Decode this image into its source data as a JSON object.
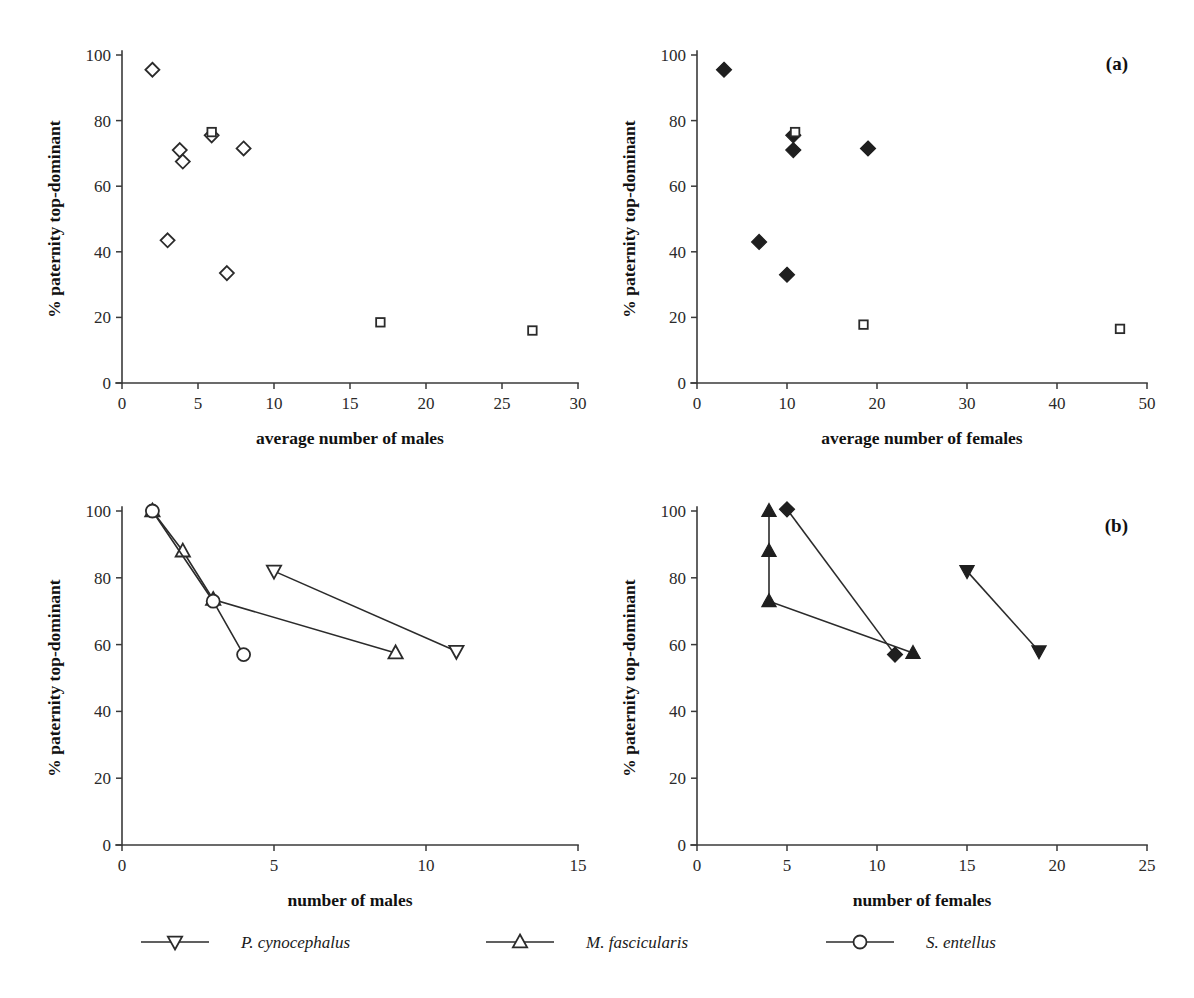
{
  "figure": {
    "panel_labels": {
      "a": "(a)",
      "b": "(b)"
    },
    "y_axis_title": "% paternity top-dominant"
  },
  "legend": {
    "position": "bottom-center",
    "entries": [
      {
        "label": "P. cynocephalus",
        "marker": "triangle-down",
        "filled_in_panel_b": true
      },
      {
        "label": "M. fascicularis",
        "marker": "triangle-up",
        "filled_in_panel_b": true
      },
      {
        "label": "S. entellus",
        "marker": "circle",
        "filled_in_panel_b": true
      }
    ]
  },
  "chart_data": [
    {
      "id": "panel-a-males",
      "type": "scatter",
      "title": "",
      "panel": "(a)",
      "xlabel": "average number of males",
      "ylabel": "% paternity top-dominant",
      "xlim": [
        0,
        30
      ],
      "ylim": [
        0,
        100
      ],
      "xticks": [
        0,
        5,
        10,
        15,
        20,
        25,
        30
      ],
      "yticks": [
        0,
        20,
        40,
        60,
        80,
        100
      ],
      "grid": false,
      "series": [
        {
          "name": "open diamonds",
          "marker": "diamond-open",
          "points": [
            {
              "x": 2.0,
              "y": 95.5
            },
            {
              "x": 3.0,
              "y": 43.5
            },
            {
              "x": 3.8,
              "y": 71.0
            },
            {
              "x": 4.0,
              "y": 67.5
            },
            {
              "x": 5.9,
              "y": 75.5
            },
            {
              "x": 6.9,
              "y": 33.5
            },
            {
              "x": 8.0,
              "y": 71.5
            }
          ]
        },
        {
          "name": "open squares",
          "marker": "square-open",
          "points": [
            {
              "x": 5.9,
              "y": 76.5
            },
            {
              "x": 17.0,
              "y": 18.5
            },
            {
              "x": 27.0,
              "y": 16.0
            }
          ]
        }
      ]
    },
    {
      "id": "panel-a-females",
      "type": "scatter",
      "title": "",
      "panel": "(a)",
      "xlabel": "average number of females",
      "ylabel": "% paternity top-dominant",
      "xlim": [
        0,
        50
      ],
      "ylim": [
        0,
        100
      ],
      "xticks": [
        0,
        10,
        20,
        30,
        40,
        50
      ],
      "yticks": [
        0,
        20,
        40,
        60,
        80,
        100
      ],
      "grid": false,
      "series": [
        {
          "name": "filled diamonds",
          "marker": "diamond-filled",
          "points": [
            {
              "x": 3.0,
              "y": 95.5
            },
            {
              "x": 6.9,
              "y": 43.0
            },
            {
              "x": 10.0,
              "y": 33.0
            },
            {
              "x": 10.7,
              "y": 75.5
            },
            {
              "x": 10.7,
              "y": 71.0
            },
            {
              "x": 19.0,
              "y": 71.5
            }
          ]
        },
        {
          "name": "open squares",
          "marker": "square-open",
          "points": [
            {
              "x": 10.9,
              "y": 76.5
            },
            {
              "x": 18.5,
              "y": 17.8
            },
            {
              "x": 47.0,
              "y": 16.5
            }
          ]
        }
      ]
    },
    {
      "id": "panel-b-males",
      "type": "line",
      "title": "",
      "panel": "(b)",
      "xlabel": "number of males",
      "ylabel": "% paternity top-dominant",
      "xlim": [
        0,
        15
      ],
      "ylim": [
        0,
        100
      ],
      "xticks": [
        0,
        5,
        10,
        15
      ],
      "yticks": [
        0,
        20,
        40,
        60,
        80,
        100
      ],
      "grid": false,
      "series": [
        {
          "name": "P. cynocephalus",
          "marker": "triangle-down-open",
          "points": [
            {
              "x": 5.0,
              "y": 82.0
            },
            {
              "x": 11.0,
              "y": 58.0
            }
          ]
        },
        {
          "name": "M. fascicularis",
          "marker": "triangle-up-open",
          "points": [
            {
              "x": 1.0,
              "y": 100.0
            },
            {
              "x": 2.0,
              "y": 88.0
            },
            {
              "x": 3.0,
              "y": 73.5
            },
            {
              "x": 9.0,
              "y": 57.5
            }
          ]
        },
        {
          "name": "S. entellus",
          "marker": "circle-open",
          "points": [
            {
              "x": 1.0,
              "y": 100.0
            },
            {
              "x": 3.0,
              "y": 73.0
            },
            {
              "x": 4.0,
              "y": 57.0
            }
          ]
        }
      ]
    },
    {
      "id": "panel-b-females",
      "type": "line",
      "title": "",
      "panel": "(b)",
      "xlabel": "number of females",
      "ylabel": "% paternity top-dominant",
      "xlim": [
        0,
        25
      ],
      "ylim": [
        0,
        100
      ],
      "xticks": [
        0,
        5,
        10,
        15,
        20,
        25
      ],
      "yticks": [
        0,
        20,
        40,
        60,
        80,
        100
      ],
      "grid": false,
      "series": [
        {
          "name": "P. cynocephalus",
          "marker": "triangle-down-filled",
          "points": [
            {
              "x": 15.0,
              "y": 82.0
            },
            {
              "x": 19.0,
              "y": 58.0
            }
          ]
        },
        {
          "name": "M. fascicularis",
          "marker": "triangle-up-filled",
          "points": [
            {
              "x": 4.0,
              "y": 100.0
            },
            {
              "x": 4.0,
              "y": 88.0
            },
            {
              "x": 4.0,
              "y": 73.0
            },
            {
              "x": 12.0,
              "y": 57.5
            }
          ]
        },
        {
          "name": "S. entellus",
          "marker": "diamond-filled",
          "points": [
            {
              "x": 5.0,
              "y": 100.5
            },
            {
              "x": 11.0,
              "y": 57.0
            }
          ]
        }
      ]
    }
  ]
}
